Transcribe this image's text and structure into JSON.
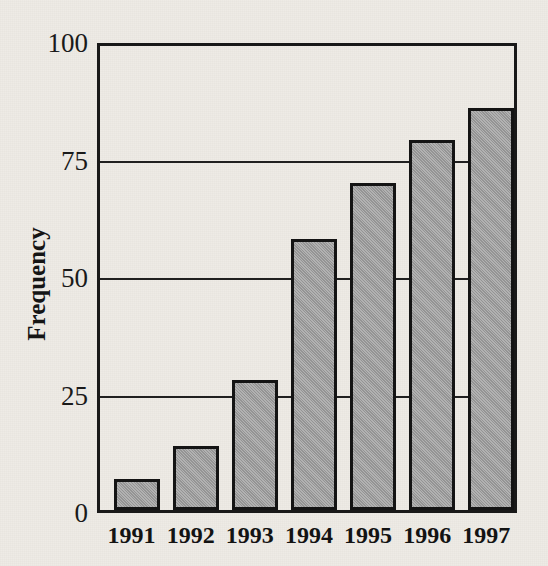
{
  "chart_data": {
    "type": "bar",
    "title": "",
    "subtitle": "",
    "xlabel": "",
    "ylabel": "Frequency",
    "categories": [
      "1991",
      "1992",
      "1993",
      "1994",
      "1995",
      "1996",
      "1997"
    ],
    "values": [
      6,
      13,
      27,
      57,
      69,
      78,
      85
    ],
    "series": [
      {
        "name": "Frequency",
        "values": [
          6,
          13,
          27,
          57,
          69,
          78,
          85
        ]
      }
    ],
    "ylim": [
      0,
      100
    ],
    "yticks": [
      0,
      25,
      50,
      75,
      100
    ],
    "ytick_labels": [
      "0",
      "25",
      "50",
      "75",
      "100"
    ],
    "grid": true,
    "grid_axis": "y",
    "legend": false,
    "legend_position": "none",
    "annotations": [],
    "colors": {
      "bar_fill": "#9c9c9c",
      "bar_edge": "#141414",
      "axis": "#191919",
      "grid": "#202020",
      "text": "#131313",
      "background": "#eeebe5"
    }
  }
}
